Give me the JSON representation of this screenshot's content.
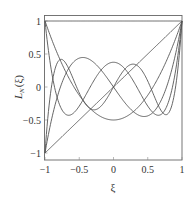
{
  "chart_data": {
    "type": "line",
    "title": "",
    "xlabel": "ξ",
    "ylabel": "L_N(ξ)",
    "ylabel_main": "L",
    "ylabel_sub": "N",
    "ylabel_tail": "(ξ)",
    "xlim": [
      -1,
      1
    ],
    "ylim": [
      -1.1,
      1.1
    ],
    "grid": false,
    "legend": null,
    "x_ticks": [
      -1,
      -0.5,
      0,
      0.5,
      1
    ],
    "x_tick_labels": [
      "−1",
      "−0.5",
      "0",
      "0.5",
      "1"
    ],
    "y_ticks": [
      1,
      0.5,
      0,
      -0.5,
      -1
    ],
    "y_tick_labels": [
      "1",
      "0.5",
      "0",
      "−0.5",
      "−1"
    ],
    "x": [
      -1,
      -0.9,
      -0.8,
      -0.7,
      -0.6,
      -0.5,
      -0.4,
      -0.3,
      -0.2,
      -0.1,
      0,
      0.1,
      0.2,
      0.3,
      0.4,
      0.5,
      0.6,
      0.7,
      0.8,
      0.9,
      1
    ],
    "series": [
      {
        "name": "L0",
        "values": [
          1,
          1,
          1,
          1,
          1,
          1,
          1,
          1,
          1,
          1,
          1,
          1,
          1,
          1,
          1,
          1,
          1,
          1,
          1,
          1,
          1
        ]
      },
      {
        "name": "L1",
        "values": [
          -1,
          -0.9,
          -0.8,
          -0.7,
          -0.6,
          -0.5,
          -0.4,
          -0.3,
          -0.2,
          -0.1,
          0,
          0.1,
          0.2,
          0.3,
          0.4,
          0.5,
          0.6,
          0.7,
          0.8,
          0.9,
          1
        ]
      },
      {
        "name": "L2",
        "values": [
          1,
          0.715,
          0.46,
          0.235,
          0.04,
          -0.125,
          -0.26,
          -0.365,
          -0.44,
          -0.485,
          -0.5,
          -0.485,
          -0.44,
          -0.365,
          -0.26,
          -0.125,
          0.04,
          0.235,
          0.46,
          0.715,
          1
        ]
      },
      {
        "name": "L3",
        "values": [
          -1,
          -0.4725,
          -0.08,
          0.1925,
          0.36,
          0.4375,
          0.44,
          0.3825,
          0.28,
          0.1475,
          0,
          -0.1475,
          -0.28,
          -0.3825,
          -0.44,
          -0.4375,
          -0.36,
          -0.1925,
          0.08,
          0.4725,
          1
        ]
      },
      {
        "name": "L4",
        "values": [
          1,
          0.2079,
          -0.2325,
          -0.4121,
          -0.408,
          -0.2891,
          -0.113,
          0.0729,
          0.232,
          0.3379,
          0.375,
          0.3379,
          0.232,
          0.0729,
          -0.113,
          -0.2891,
          -0.408,
          -0.4121,
          -0.2325,
          0.2079,
          1
        ]
      },
      {
        "name": "L5",
        "values": [
          -1,
          0.0412,
          0.4,
          0.3652,
          0.1526,
          -0.0898,
          -0.2706,
          -0.3454,
          -0.3075,
          -0.1788,
          0,
          0.1788,
          0.3075,
          0.3454,
          0.2706,
          0.0898,
          -0.1526,
          -0.3652,
          -0.4,
          -0.0412,
          1
        ]
      }
    ]
  }
}
